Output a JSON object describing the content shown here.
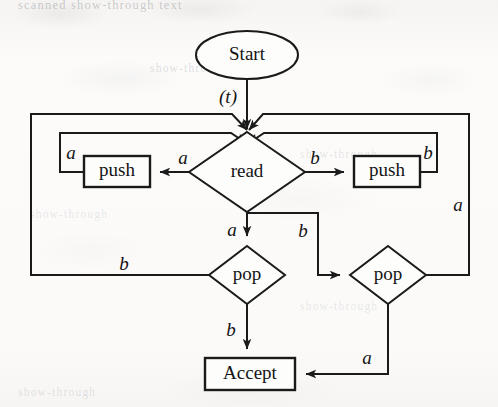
{
  "figure": {
    "kind": "flowchart",
    "ink_color": "#1a1a1a",
    "paper_color": "#fbfbfa"
  },
  "ghost_text": {
    "line1": "scanned show-through text",
    "line2": "show-through",
    "line3": "show-through",
    "line4": "show-through",
    "line5": "show-through",
    "line6": "show-through"
  },
  "nodes": {
    "start": {
      "label": "Start",
      "shape": "ellipse",
      "cx": 247,
      "cy": 55,
      "rx": 51,
      "ry": 24
    },
    "read": {
      "label": "read",
      "shape": "diamond",
      "cx": 247,
      "cy": 172,
      "rx": 58,
      "ry": 40
    },
    "push_left": {
      "label": "push",
      "shape": "rect",
      "x": 84,
      "y": 156,
      "w": 66,
      "h": 31
    },
    "push_right": {
      "label": "push",
      "shape": "rect",
      "x": 354,
      "y": 156,
      "w": 66,
      "h": 31
    },
    "pop_left": {
      "label": "pop",
      "shape": "diamond",
      "cx": 247,
      "cy": 275,
      "rx": 38,
      "ry": 29
    },
    "pop_right": {
      "label": "pop",
      "shape": "diamond",
      "cx": 388,
      "cy": 275,
      "rx": 38,
      "ry": 29
    },
    "accept": {
      "label": "Accept",
      "shape": "rect",
      "x": 205,
      "y": 358,
      "w": 90,
      "h": 32
    }
  },
  "edge_labels": {
    "start_to_read": "(t)",
    "read_to_push_left": "a",
    "read_to_push_right": "b",
    "push_left_loop": "a",
    "push_right_loop": "b",
    "read_to_pop_left": "a",
    "read_to_pop_right": "b",
    "pop_left_to_read": "b",
    "pop_left_to_accept": "b",
    "pop_right_to_read": "a",
    "pop_right_to_accept": "a"
  },
  "edges": [
    {
      "from": "start",
      "to": "read",
      "label": "(t)"
    },
    {
      "from": "read",
      "to": "push_left",
      "label": "a"
    },
    {
      "from": "read",
      "to": "push_right",
      "label": "b"
    },
    {
      "from": "push_left",
      "to": "read",
      "label": "a"
    },
    {
      "from": "push_right",
      "to": "read",
      "label": "b"
    },
    {
      "from": "read",
      "to": "pop_left",
      "label": "a"
    },
    {
      "from": "read",
      "to": "pop_right",
      "label": "b"
    },
    {
      "from": "pop_left",
      "to": "read",
      "label": "b"
    },
    {
      "from": "pop_left",
      "to": "accept",
      "label": "b"
    },
    {
      "from": "pop_right",
      "to": "read",
      "label": "a"
    },
    {
      "from": "pop_right",
      "to": "accept",
      "label": "a"
    }
  ]
}
